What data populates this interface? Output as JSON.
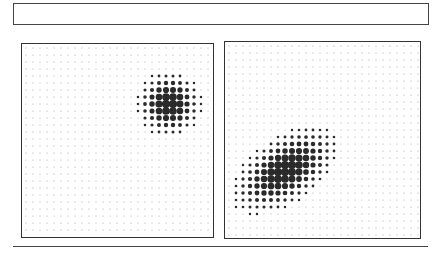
{
  "header_box": {
    "text": ""
  },
  "panels": [
    {
      "name": "left",
      "x": 21,
      "y": 43,
      "w": 191,
      "h": 193,
      "grid": {
        "cols": 27,
        "rows": 27,
        "spacing": 7.0,
        "offset_x": 4,
        "offset_y": 4
      },
      "blob": {
        "type": "circular",
        "cx": 147,
        "cy": 60,
        "sx": 16,
        "sy": 16,
        "rot": 0,
        "max_r": 3.4
      }
    },
    {
      "name": "right",
      "x": 224,
      "y": 41,
      "w": 195,
      "h": 196,
      "grid": {
        "cols": 28,
        "rows": 28,
        "spacing": 7.0,
        "offset_x": 4,
        "offset_y": 4
      },
      "blob": {
        "type": "elongated",
        "cx": 60,
        "cy": 128,
        "sx": 30,
        "sy": 16,
        "rot": -35,
        "max_r": 3.4
      }
    }
  ],
  "colors": {
    "dot": "#2a2a2a",
    "faint_dot": "#9a9a9a",
    "border": "#333333"
  }
}
